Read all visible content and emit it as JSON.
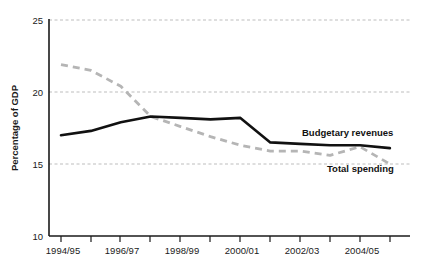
{
  "chart_data": {
    "type": "line",
    "title": "",
    "xlabel": "",
    "ylabel": "Percentage of GDP",
    "ylim": [
      10,
      25
    ],
    "yticks": [
      10,
      15,
      20,
      25
    ],
    "ytick_labels": [
      "10",
      "15",
      "20",
      "25"
    ],
    "grid": true,
    "legend_position": "inline-right",
    "x": [
      "1994/95",
      "1995/96",
      "1996/97",
      "1997/98",
      "1998/99",
      "1999/00",
      "2000/01",
      "2001/02",
      "2002/03",
      "2003/04",
      "2004/05",
      "2005/06"
    ],
    "xtick_labels": [
      "1994/95",
      "",
      "1996/97",
      "",
      "1998/99",
      "",
      "2000/01",
      "",
      "2002/03",
      "",
      "2004/05",
      ""
    ],
    "series": [
      {
        "name": "Budgetary revenues",
        "style": "solid",
        "color": "#111111",
        "values": [
          17.0,
          17.3,
          17.9,
          18.3,
          18.2,
          18.1,
          18.2,
          16.5,
          16.4,
          16.3,
          16.3,
          16.1
        ]
      },
      {
        "name": "Total spending",
        "style": "dashed",
        "color": "#b5b5b5",
        "values": [
          21.9,
          21.5,
          20.4,
          18.3,
          17.6,
          16.9,
          16.3,
          15.9,
          15.9,
          15.6,
          16.2,
          15.0
        ]
      }
    ],
    "annotations": [
      {
        "text": "Budgetary revenues",
        "x_px": 302,
        "y_px": 136
      },
      {
        "text": "Total spending",
        "x_px": 327,
        "y_px": 172
      }
    ]
  },
  "axis": {
    "y_title": "Percentage of GDP",
    "y_labels": [
      "25",
      "20",
      "15",
      "10"
    ],
    "x_labels": [
      "1994/95",
      "1996/97",
      "1998/99",
      "2000/01",
      "2002/03",
      "2004/05"
    ]
  },
  "legend": {
    "budgetary_revenues": "Budgetary revenues",
    "total_spending": "Total spending"
  },
  "colors": {
    "solid_series": "#111111",
    "dashed_series": "#b5b5b5",
    "gridline": "#bdbdbd",
    "axis": "#1a1a1a",
    "background": "#ffffff"
  }
}
